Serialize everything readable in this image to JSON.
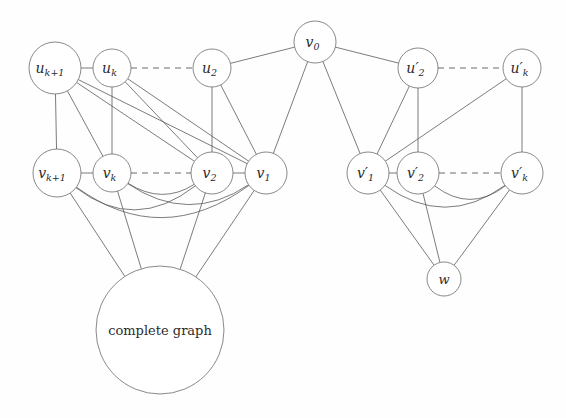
{
  "figure": {
    "background_color": "#fefefe",
    "edge_color": "#5a5a5a",
    "node_fill": "#ffffff",
    "node_stroke": "#6b6b6b",
    "label_color": "#2b2b2b"
  },
  "nodes": [
    {
      "id": "u_kplus1",
      "label": "u",
      "sub": "k+1",
      "x": 55,
      "y": 68,
      "r": 26,
      "font_size": 14
    },
    {
      "id": "u_k",
      "label": "u",
      "sub": "k",
      "x": 112,
      "y": 68,
      "r": 19,
      "font_size": 14
    },
    {
      "id": "u_2",
      "label": "u",
      "sub": "2",
      "x": 212,
      "y": 68,
      "r": 19,
      "font_size": 14
    },
    {
      "id": "v_0",
      "label": "v",
      "sub": "0",
      "x": 315,
      "y": 42,
      "r": 21,
      "font_size": 14
    },
    {
      "id": "u_2p",
      "label": "u′",
      "sub": "2",
      "x": 418,
      "y": 68,
      "r": 20,
      "font_size": 14
    },
    {
      "id": "u_kp",
      "label": "u′",
      "sub": "k",
      "x": 522,
      "y": 68,
      "r": 19,
      "font_size": 14
    },
    {
      "id": "v_kplus1",
      "label": "v",
      "sub": "k+1",
      "x": 57,
      "y": 173,
      "r": 24,
      "font_size": 14
    },
    {
      "id": "v_k",
      "label": "v",
      "sub": "k",
      "x": 112,
      "y": 173,
      "r": 19,
      "font_size": 14
    },
    {
      "id": "v_2",
      "label": "v",
      "sub": "2",
      "x": 212,
      "y": 173,
      "r": 21,
      "font_size": 14
    },
    {
      "id": "v_1",
      "label": "v",
      "sub": "1",
      "x": 266,
      "y": 173,
      "r": 21,
      "font_size": 14
    },
    {
      "id": "v_1p",
      "label": "v′",
      "sub": "1",
      "x": 368,
      "y": 173,
      "r": 21,
      "font_size": 14
    },
    {
      "id": "v_2p",
      "label": "v′",
      "sub": "2",
      "x": 418,
      "y": 173,
      "r": 21,
      "font_size": 14
    },
    {
      "id": "v_kp",
      "label": "v′",
      "sub": "k",
      "x": 522,
      "y": 173,
      "r": 21,
      "font_size": 14
    },
    {
      "id": "w",
      "label": "w",
      "sub": "",
      "x": 444,
      "y": 279,
      "r": 17,
      "font_size": 13
    }
  ],
  "blob": {
    "id": "complete_graph",
    "label": "complete graph",
    "x": 160,
    "y": 330,
    "r": 64
  },
  "edges_straight": [
    {
      "from": "u_kplus1",
      "to": "u_k",
      "name": "edge-ukplus1-uk"
    },
    {
      "from": "u_2",
      "to": "v_0",
      "name": "edge-u2-v0"
    },
    {
      "from": "v_0",
      "to": "u_2p",
      "name": "edge-v0-u2p"
    },
    {
      "from": "v_0",
      "to": "v_1",
      "name": "edge-v0-v1"
    },
    {
      "from": "v_0",
      "to": "v_1p",
      "name": "edge-v0-v1p"
    },
    {
      "from": "u_kplus1",
      "to": "v_kplus1",
      "name": "edge-ukplus1-vkplus1"
    },
    {
      "from": "u_kplus1",
      "to": "v_k",
      "name": "edge-ukplus1-vk"
    },
    {
      "from": "u_kplus1",
      "to": "v_2",
      "name": "edge-ukplus1-v2"
    },
    {
      "from": "u_kplus1",
      "to": "v_1",
      "name": "edge-ukplus1-v1"
    },
    {
      "from": "u_k",
      "to": "v_k",
      "name": "edge-uk-vk"
    },
    {
      "from": "u_k",
      "to": "v_2",
      "name": "edge-uk-v2"
    },
    {
      "from": "u_k",
      "to": "v_1",
      "name": "edge-uk-v1"
    },
    {
      "from": "u_2",
      "to": "v_2",
      "name": "edge-u2-v2"
    },
    {
      "from": "u_2",
      "to": "v_1",
      "name": "edge-u2-v1"
    },
    {
      "from": "v_kplus1",
      "to": "v_k",
      "name": "edge-vkplus1-vk"
    },
    {
      "from": "v_2",
      "to": "v_1",
      "name": "edge-v2-v1"
    },
    {
      "from": "u_2p",
      "to": "v_2p",
      "name": "edge-u2p-v2p"
    },
    {
      "from": "u_2p",
      "to": "v_1p",
      "name": "edge-u2p-v1p"
    },
    {
      "from": "u_kp",
      "to": "v_kp",
      "name": "edge-ukp-vkp"
    },
    {
      "from": "u_kp",
      "to": "v_1p",
      "name": "edge-ukp-v1p"
    },
    {
      "from": "v_1p",
      "to": "v_2p",
      "name": "edge-v1p-v2p"
    }
  ],
  "edges_dashed": [
    {
      "from": "u_k",
      "to": "u_2",
      "name": "edge-dashed-uk-u2"
    },
    {
      "from": "v_k",
      "to": "v_2",
      "name": "edge-dashed-vk-v2"
    },
    {
      "from": "u_2p",
      "to": "u_kp",
      "name": "edge-dashed-u2p-ukp"
    },
    {
      "from": "v_2p",
      "to": "v_kp",
      "name": "edge-dashed-v2p-vkp"
    }
  ],
  "edges_arc": [
    {
      "from": "v_kplus1",
      "to": "v_2",
      "bulge": 30,
      "name": "arc-vkplus1-v2"
    },
    {
      "from": "v_kplus1",
      "to": "v_1",
      "bulge": 38,
      "name": "arc-vkplus1-v1"
    },
    {
      "from": "v_k",
      "to": "v_2",
      "bulge": 16,
      "name": "arc-vk-v2"
    },
    {
      "from": "v_k",
      "to": "v_1",
      "bulge": 26,
      "name": "arc-vk-v1"
    },
    {
      "from": "v_1p",
      "to": "v_kp",
      "bulge": 28,
      "name": "arc-v1p-vkp"
    },
    {
      "from": "v_2p",
      "to": "v_kp",
      "bulge": 20,
      "name": "arc-v2p-vkp"
    }
  ],
  "edges_to_blob": [
    {
      "from": "v_kplus1",
      "name": "edge-vkplus1-complete-graph"
    },
    {
      "from": "v_k",
      "name": "edge-vk-complete-graph"
    },
    {
      "from": "v_2",
      "name": "edge-v2-complete-graph"
    },
    {
      "from": "v_1",
      "name": "edge-v1-complete-graph"
    }
  ],
  "edges_to_w": [
    {
      "from": "v_1p",
      "name": "edge-v1p-w"
    },
    {
      "from": "v_2p",
      "name": "edge-v2p-w"
    },
    {
      "from": "v_kp",
      "name": "edge-vkp-w"
    }
  ]
}
